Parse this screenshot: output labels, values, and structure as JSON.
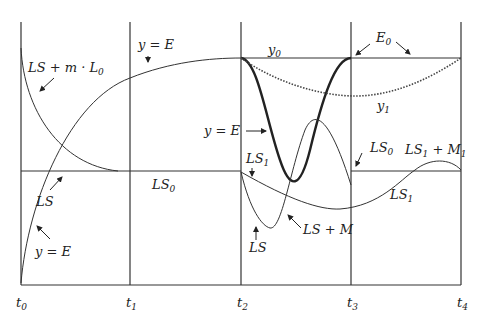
{
  "figure": {
    "type": "diagram",
    "time_ticks": [
      {
        "base": "t",
        "sub": "0"
      },
      {
        "base": "t",
        "sub": "1"
      },
      {
        "base": "t",
        "sub": "2"
      },
      {
        "base": "t",
        "sub": "3"
      },
      {
        "base": "t",
        "sub": "4"
      }
    ],
    "labels": {
      "ls_plus_mL0": {
        "main": "LS + m · L",
        "sub": "0"
      },
      "y_eq_E_top": "y = E",
      "y_eq_E_mid": "y = E",
      "y_eq_E_bottom": "y = E",
      "ls_left": "LS",
      "ls0_mid": {
        "main": "LS",
        "sub": "0"
      },
      "y0": {
        "main": "y",
        "sub": "0"
      },
      "E0": {
        "main": "E",
        "sub": "0"
      },
      "y1": {
        "main": "y",
        "sub": "1"
      },
      "ls1_upper": {
        "main": "LS",
        "sub": "1"
      },
      "ls_lower": "LS",
      "ls_plus_M": "LS + M",
      "ls0_right": {
        "main": "LS",
        "sub": "0"
      },
      "ls1_plus_M1": {
        "main": "LS",
        "sub1": "1",
        "mid": " + M",
        "sub2": "1"
      },
      "ls1_right": {
        "main": "LS",
        "sub": "1"
      }
    },
    "curves": [
      "LS + m·L0 decaying from t0 to LS0 level at t1",
      "y = E rising from t0 to E0 level at t2",
      "LS0 constant from t1 to t2",
      "y = E bold dip between t2 and t3 (y0 level to minimum and back)",
      "y1 dotted arc from t2 to t4 below E0",
      "LS1 slow dip from t2 to t4",
      "LS dip from t2 and LS + M hump rising to peak then down to LS0 at t3",
      "LS1 + M1 bump near t4"
    ]
  }
}
